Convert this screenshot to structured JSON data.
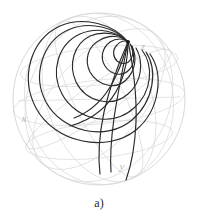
{
  "figure": {
    "caption": "a)",
    "kind": "sphere-phase-portrait"
  },
  "axes": {
    "x_label": "x",
    "y_label": "y",
    "z_label": "z"
  },
  "colors": {
    "background": "#ffffff",
    "sphere_outline": "#d2d2d2",
    "grid": "#d8d8d8",
    "trajectory": "#2a2a2a",
    "axis_label": "#b9b9b9",
    "caption": "#2b2b2b"
  },
  "chart_data": {
    "type": "line",
    "title": "",
    "subtitle": "",
    "xlabel": "",
    "ylabel": "",
    "legend": [],
    "grid": true,
    "legend_position": "none",
    "projection": "orthographic-sphere",
    "sphere": {
      "center_x": 99,
      "center_y": 99,
      "radius": 86
    },
    "focus_point": {
      "x": 128,
      "y": 42,
      "label": "stable focus"
    },
    "axis_label_positions": [
      {
        "name": "z",
        "x": 143,
        "y": 50
      },
      {
        "name": "x",
        "x": 24,
        "y": 122
      },
      {
        "name": "y",
        "x": 122,
        "y": 170
      }
    ],
    "graticule": {
      "meridian_count": 6,
      "parallel_count": 3,
      "parallels_latitude_deg": [
        40,
        0,
        -40
      ]
    },
    "series": [
      {
        "name": "trajectory-1",
        "path": "M 128 42 C 118 32 98 26 80 34 C 58 44 50 72 62 94 C 76 120 112 128 134 108 C 152 92 154 66 142 50"
      },
      {
        "name": "trajectory-2",
        "path": "M 128 42 C 116 28 90 20 68 30 C 42 42 32 76 46 102 C 62 132 106 142 132 120 C 154 101 158 70 146 52"
      },
      {
        "name": "trajectory-3",
        "path": "M 128 42 C 114 24 84 16 60 26 C 30 40 20 78 36 108 C 54 142 106 154 136 130 C 160 110 164 74 150 54"
      },
      {
        "name": "trajectory-4",
        "path": "M 128 42 C 120 34 104 30 90 36 C 74 44 68 64 76 82 C 86 102 112 108 128 94 C 142 82 144 62 136 48"
      },
      {
        "name": "trajectory-5",
        "path": "M 128 42 C 122 36 110 34 100 40 C 88 46 84 60 90 72 C 98 86 116 90 126 80 C 136 70 137 57 132 46"
      },
      {
        "name": "trajectory-6",
        "path": "M 128 42 C 124 38 116 38 110 42 C 102 48 100 58 105 66 C 111 75 122 77 129 70 C 135 64 135 54 131 46"
      },
      {
        "name": "trajectory-7",
        "path": "M 128 42 C 125 40 120 41 117 45 C 112 50 113 57 117 61 C 122 65 128 64 131 59 C 134 54 133 47 130 44"
      },
      {
        "name": "trajectory-8",
        "path": "M 128 42 C 120 60 110 86 104 112 C 99 136 98 158 100 174"
      },
      {
        "name": "trajectory-9",
        "path": "M 128 42 C 124 62 118 92 114 118 C 111 140 110 158 111 172"
      },
      {
        "name": "trajectory-10",
        "path": "M 128 42 C 133 64 137 96 136 122 C 135 146 131 166 126 180"
      },
      {
        "name": "trajectory-11",
        "path": "M 128 42 C 126 50 121 66 114 80 C 104 100 90 112 74 118"
      },
      {
        "name": "trajectory-12",
        "path": "M 128 42 C 128 54 126 70 120 84 C 110 106 92 120 70 126"
      }
    ]
  }
}
